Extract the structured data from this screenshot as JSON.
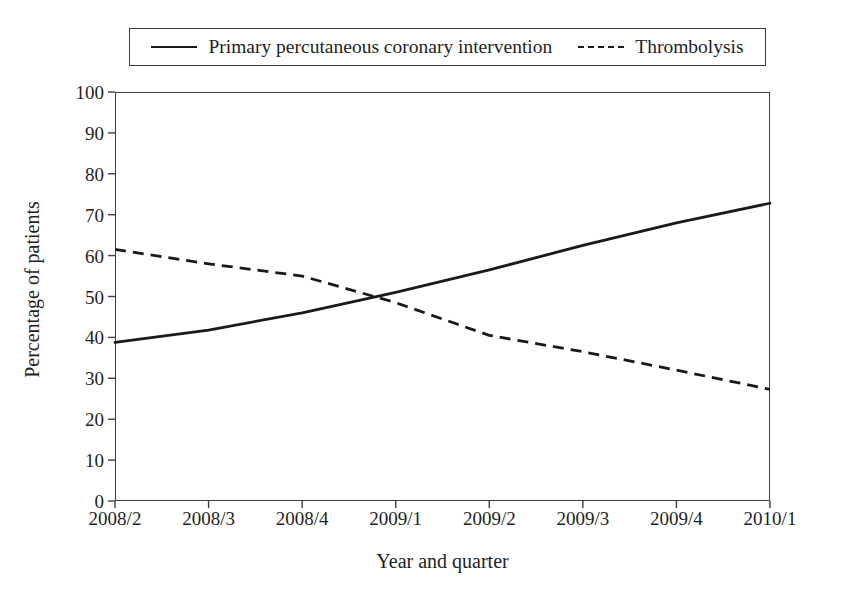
{
  "chart_data": {
    "type": "line",
    "title": "",
    "xlabel": "Year and quarter",
    "ylabel": "Percentage of patients",
    "categories": [
      "2008/2",
      "2008/3",
      "2008/4",
      "2009/1",
      "2009/2",
      "2009/3",
      "2009/4",
      "2010/1"
    ],
    "series": [
      {
        "name": "Primary percutaneous coronary intervention",
        "style": "solid",
        "color": "#1a1a1a",
        "values": [
          38.8,
          41.8,
          46.0,
          51.0,
          56.5,
          62.5,
          68.0,
          72.8
        ]
      },
      {
        "name": "Thrombolysis",
        "style": "dashed",
        "color": "#1a1a1a",
        "values": [
          61.5,
          58.0,
          55.0,
          48.5,
          40.5,
          36.5,
          32.0,
          27.3
        ]
      }
    ],
    "ylim": [
      0,
      100
    ],
    "ytick_values": [
      0,
      10,
      20,
      30,
      40,
      50,
      60,
      70,
      80,
      90,
      100
    ],
    "ytick_labels": [
      "0",
      "10",
      "20",
      "30",
      "40",
      "50",
      "60",
      "70",
      "80",
      "90",
      "100"
    ],
    "grid": false,
    "legend_position": "top",
    "crossing_point": {
      "x_between": [
        "2008/4",
        "2009/1"
      ],
      "value": 50
    }
  },
  "legend": {
    "entries": [
      {
        "label": "Primary percutaneous coronary intervention",
        "style": "solid"
      },
      {
        "label": "Thrombolysis",
        "style": "dashed"
      }
    ]
  }
}
